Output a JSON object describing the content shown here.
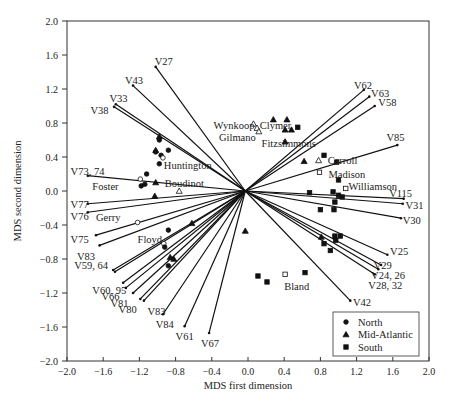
{
  "chart_data": {
    "type": "scatter",
    "subtype": "biplot",
    "title": "",
    "xlabel": "MDS first dimension",
    "ylabel": "MDS second dimension",
    "xlim": [
      -2.0,
      2.0
    ],
    "ylim": [
      -2.0,
      2.0
    ],
    "xticks": [
      "-2.0",
      "-1.6",
      "-1.2",
      "-0.8",
      "-0.4",
      "0.0",
      "0.4",
      "0.8",
      "1.2",
      "1.6",
      "2.0"
    ],
    "yticks": [
      "2.0",
      "1.6",
      "1.2",
      "0.8",
      "0.4",
      "0.0",
      "-0.4",
      "-0.8",
      "-1.2",
      "-1.6",
      "-2.0"
    ],
    "grid": false,
    "legend_position": "lower right",
    "legend": [
      {
        "label": "North",
        "marker": "circle"
      },
      {
        "label": "Mid-Atlantic",
        "marker": "triangle"
      },
      {
        "label": "South",
        "marker": "square"
      }
    ],
    "vector_origin": [
      -0.03,
      0.0
    ],
    "vectors": [
      {
        "label": "V27",
        "x": -1.02,
        "y": 1.46,
        "lx": -1.03,
        "ly": 1.53
      },
      {
        "label": "V43",
        "x": -1.27,
        "y": 1.24,
        "lx": -1.36,
        "ly": 1.31
      },
      {
        "label": "V33",
        "x": -1.46,
        "y": 1.02,
        "lx": -1.53,
        "ly": 1.09
      },
      {
        "label": "V38",
        "x": -1.48,
        "y": 0.99,
        "lx": -1.74,
        "ly": 0.95
      },
      {
        "label": "V73, 74",
        "x": -1.77,
        "y": 0.18,
        "lx": -1.96,
        "ly": 0.24
      },
      {
        "label": "V77",
        "x": -1.77,
        "y": -0.15,
        "lx": -1.96,
        "ly": -0.15
      },
      {
        "label": "V76",
        "x": -1.77,
        "y": -0.25,
        "lx": -1.96,
        "ly": -0.29
      },
      {
        "label": "V75",
        "x": -1.68,
        "y": -0.52,
        "lx": -1.96,
        "ly": -0.56
      },
      {
        "label": "V83",
        "x": -1.64,
        "y": -0.64,
        "lx": -1.89,
        "ly": -0.76
      },
      {
        "label": "V59, 64",
        "x": -1.49,
        "y": -0.93,
        "lx": -1.92,
        "ly": -0.87
      },
      {
        "label": "V59b",
        "x": -1.47,
        "y": -0.95,
        "hidden_label": true
      },
      {
        "label": "V60, 95",
        "x": -1.38,
        "y": -1.08,
        "lx": -1.72,
        "ly": -1.17
      },
      {
        "label": "V66",
        "x": -1.35,
        "y": -1.14,
        "lx": -1.62,
        "ly": -1.24
      },
      {
        "label": "V81",
        "x": -1.27,
        "y": -1.2,
        "lx": -1.52,
        "ly": -1.32
      },
      {
        "label": "V80",
        "x": -1.19,
        "y": -1.27,
        "lx": -1.43,
        "ly": -1.39
      },
      {
        "label": "V83",
        "x": -1.15,
        "y": -1.29,
        "lx": -1.11,
        "ly": -1.41
      },
      {
        "label": "V84",
        "x": -0.94,
        "y": -1.45,
        "lx": -1.02,
        "ly": -1.57
      },
      {
        "label": "V61",
        "x": -0.7,
        "y": -1.59,
        "lx": -0.8,
        "ly": -1.71
      },
      {
        "label": "V67",
        "x": -0.43,
        "y": -1.67,
        "lx": -0.52,
        "ly": -1.79
      },
      {
        "label": "V62",
        "x": 1.28,
        "y": 1.19,
        "lx": 1.17,
        "ly": 1.25
      },
      {
        "label": "V63",
        "x": 1.34,
        "y": 1.11,
        "lx": 1.36,
        "ly": 1.15
      },
      {
        "label": "V58",
        "x": 1.4,
        "y": 1.0,
        "lx": 1.44,
        "ly": 1.05
      },
      {
        "label": "V85",
        "x": 1.65,
        "y": 0.54,
        "lx": 1.53,
        "ly": 0.63
      },
      {
        "label": "V115",
        "x": 1.72,
        "y": -0.09,
        "lx": 1.56,
        "ly": -0.02
      },
      {
        "label": "V31",
        "x": 1.71,
        "y": -0.15,
        "lx": 1.74,
        "ly": -0.17
      },
      {
        "label": "V30",
        "x": 1.69,
        "y": -0.32,
        "lx": 1.71,
        "ly": -0.34
      },
      {
        "label": "V25",
        "x": 1.54,
        "y": -0.75,
        "lx": 1.57,
        "ly": -0.71
      },
      {
        "label": "V29",
        "x": 1.47,
        "y": -0.87,
        "lx": 1.39,
        "ly": -0.87
      },
      {
        "label": "V24, 26",
        "x": 1.44,
        "y": -0.92,
        "lx": 1.36,
        "ly": -0.99
      },
      {
        "label": "V28, 32",
        "x": 1.4,
        "y": -0.98,
        "lx": 1.33,
        "ly": -1.1
      },
      {
        "label": "V42",
        "x": 1.13,
        "y": -1.29,
        "lx": 1.16,
        "ly": -1.31
      }
    ],
    "points": [
      {
        "region": "North",
        "x": -0.98,
        "y": 0.6,
        "filled": true
      },
      {
        "region": "North",
        "x": -1.02,
        "y": 0.46,
        "filled": true
      },
      {
        "region": "North",
        "x": -0.96,
        "y": 0.42,
        "filled": true
      },
      {
        "region": "North",
        "x": -0.88,
        "y": 0.48,
        "filled": true
      },
      {
        "region": "North",
        "x": -0.98,
        "y": 0.32,
        "filled": true
      },
      {
        "region": "North",
        "x": -1.12,
        "y": 0.2,
        "filled": true
      },
      {
        "region": "North",
        "x": -1.18,
        "y": 0.06,
        "filled": true
      },
      {
        "region": "North",
        "x": -1.14,
        "y": 0.08,
        "filled": true
      },
      {
        "region": "North",
        "x": -1.19,
        "y": 0.14,
        "filled": false,
        "name": "Foster"
      },
      {
        "region": "North",
        "x": -0.94,
        "y": 0.39,
        "filled": false,
        "name": "Huntington"
      },
      {
        "region": "North",
        "x": -1.22,
        "y": -0.37,
        "filled": false,
        "name": "Gerry"
      },
      {
        "region": "North",
        "x": -0.93,
        "y": -0.62,
        "filled": false,
        "name": "Floyd"
      },
      {
        "region": "North",
        "x": -0.92,
        "y": -0.66,
        "filled": true
      },
      {
        "region": "North",
        "x": -0.88,
        "y": -0.46,
        "filled": true
      },
      {
        "region": "North",
        "x": -0.88,
        "y": -0.88,
        "filled": true
      },
      {
        "region": "Mid-Atlantic",
        "x": -1.02,
        "y": 0.48,
        "filled": true
      },
      {
        "region": "Mid-Atlantic",
        "x": -0.98,
        "y": 0.64,
        "filled": true
      },
      {
        "region": "Mid-Atlantic",
        "x": -1.02,
        "y": 0.1,
        "filled": true
      },
      {
        "region": "Mid-Atlantic",
        "x": -1.03,
        "y": -0.06,
        "filled": true
      },
      {
        "region": "Mid-Atlantic",
        "x": -0.86,
        "y": -0.78,
        "filled": true
      },
      {
        "region": "Mid-Atlantic",
        "x": -0.82,
        "y": -0.8,
        "filled": true
      },
      {
        "region": "Mid-Atlantic",
        "x": -0.62,
        "y": -0.38,
        "filled": true
      },
      {
        "region": "Mid-Atlantic",
        "x": -0.76,
        "y": 0.0,
        "filled": false,
        "name": "Boudinot"
      },
      {
        "region": "Mid-Atlantic",
        "x": 0.06,
        "y": 0.79,
        "filled": false,
        "name": "Wynkoop"
      },
      {
        "region": "Mid-Atlantic",
        "x": 0.1,
        "y": 0.74,
        "filled": false
      },
      {
        "region": "Mid-Atlantic",
        "x": 0.12,
        "y": 0.7,
        "filled": false,
        "name": "Gilmano"
      },
      {
        "region": "Mid-Atlantic",
        "x": 0.28,
        "y": 0.84,
        "filled": true,
        "name": "Clymer"
      },
      {
        "region": "Mid-Atlantic",
        "x": 0.43,
        "y": 0.84,
        "filled": true
      },
      {
        "region": "Mid-Atlantic",
        "x": 0.41,
        "y": 0.72,
        "filled": true
      },
      {
        "region": "Mid-Atlantic",
        "x": 0.48,
        "y": 0.72,
        "filled": true
      },
      {
        "region": "Mid-Atlantic",
        "x": 0.41,
        "y": 0.58,
        "filled": true,
        "name": "Fitzsimmons"
      },
      {
        "region": "Mid-Atlantic",
        "x": 0.62,
        "y": 0.35,
        "filled": true
      },
      {
        "region": "Mid-Atlantic",
        "x": 0.78,
        "y": 0.36,
        "filled": false,
        "name": "Carroll"
      },
      {
        "region": "Mid-Atlantic",
        "x": -0.03,
        "y": -0.47,
        "filled": true
      },
      {
        "region": "Mid-Atlantic",
        "x": 0.81,
        "y": -0.54,
        "filled": true
      },
      {
        "region": "South",
        "x": 0.55,
        "y": 0.75,
        "filled": true
      },
      {
        "region": "South",
        "x": 0.84,
        "y": 0.42,
        "filled": true
      },
      {
        "region": "South",
        "x": 0.98,
        "y": 0.34,
        "filled": true
      },
      {
        "region": "South",
        "x": 0.79,
        "y": 0.22,
        "filled": false,
        "name": "Madison"
      },
      {
        "region": "South",
        "x": 1.0,
        "y": 0.13,
        "filled": true,
        "name": "Williamson"
      },
      {
        "region": "South",
        "x": 1.08,
        "y": 0.03,
        "filled": false
      },
      {
        "region": "South",
        "x": 0.68,
        "y": -0.02,
        "filled": true
      },
      {
        "region": "South",
        "x": 0.94,
        "y": -0.01,
        "filled": true
      },
      {
        "region": "South",
        "x": 1.0,
        "y": -0.05,
        "filled": true
      },
      {
        "region": "South",
        "x": 1.04,
        "y": -0.07,
        "filled": true
      },
      {
        "region": "South",
        "x": 0.96,
        "y": -0.13,
        "filled": true
      },
      {
        "region": "South",
        "x": 0.8,
        "y": -0.22,
        "filled": true
      },
      {
        "region": "South",
        "x": 0.95,
        "y": -0.22,
        "filled": true
      },
      {
        "region": "South",
        "x": 0.96,
        "y": -0.53,
        "filled": true
      },
      {
        "region": "South",
        "x": 1.02,
        "y": -0.53,
        "filled": true
      },
      {
        "region": "South",
        "x": 0.97,
        "y": -0.58,
        "filled": true
      },
      {
        "region": "South",
        "x": 0.84,
        "y": -0.62,
        "filled": true
      },
      {
        "region": "South",
        "x": 0.91,
        "y": -0.7,
        "filled": true
      },
      {
        "region": "South",
        "x": 0.11,
        "y": -1.0,
        "filled": true
      },
      {
        "region": "South",
        "x": 0.21,
        "y": -1.07,
        "filled": true
      },
      {
        "region": "South",
        "x": 0.41,
        "y": -0.98,
        "filled": false,
        "name": "Bland"
      },
      {
        "region": "South",
        "x": 0.63,
        "y": -0.96,
        "filled": true
      }
    ],
    "name_labels": [
      {
        "text": "Huntington",
        "x": -0.93,
        "y": 0.31
      },
      {
        "text": "Foster",
        "x": -1.72,
        "y": 0.06
      },
      {
        "text": "Boudinot",
        "x": -0.92,
        "y": 0.1
      },
      {
        "text": "Gerry",
        "x": -1.68,
        "y": -0.31
      },
      {
        "text": "Floyd",
        "x": -1.22,
        "y": -0.57
      },
      {
        "text": "Wynkoop",
        "x": -0.38,
        "y": 0.78
      },
      {
        "text": "Clymer",
        "x": 0.13,
        "y": 0.78
      },
      {
        "text": "Gilmano",
        "x": -0.32,
        "y": 0.64
      },
      {
        "text": "Fitzsimmons",
        "x": 0.15,
        "y": 0.56
      },
      {
        "text": "Carroll",
        "x": 0.88,
        "y": 0.36
      },
      {
        "text": "Madison",
        "x": 0.89,
        "y": 0.2
      },
      {
        "text": "Williamson",
        "x": 1.11,
        "y": 0.06
      },
      {
        "text": "Bland",
        "x": 0.4,
        "y": -1.12
      }
    ]
  }
}
